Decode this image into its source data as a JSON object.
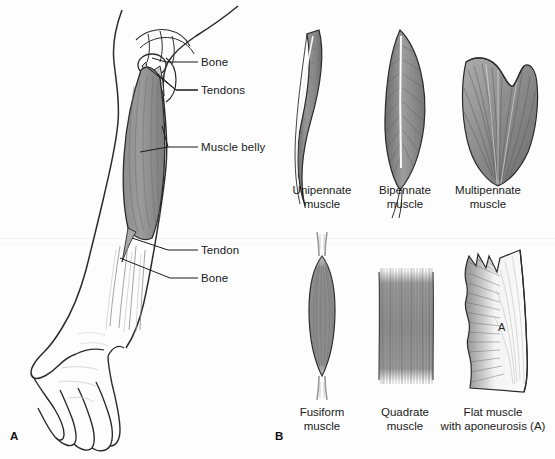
{
  "figure": {
    "panels": [
      {
        "letter": "A"
      },
      {
        "letter": "B"
      }
    ]
  },
  "panel_a": {
    "letter": "A",
    "labels": [
      {
        "id": "bone-upper",
        "text": "Bone"
      },
      {
        "id": "tendons",
        "text": "Tendons"
      },
      {
        "id": "muscle-belly",
        "text": "Muscle belly"
      },
      {
        "id": "tendon-lower",
        "text": "Tendon"
      },
      {
        "id": "bone-lower",
        "text": "Bone"
      }
    ]
  },
  "panel_b": {
    "letter": "B",
    "items": [
      {
        "id": "unipennate",
        "line1": "Unipennate",
        "line2": "muscle"
      },
      {
        "id": "bipennate",
        "line1": "Bipennate",
        "line2": "muscle"
      },
      {
        "id": "multipennate",
        "line1": "Multipennate",
        "line2": "muscle"
      },
      {
        "id": "fusiform",
        "line1": "Fusiform",
        "line2": "muscle"
      },
      {
        "id": "quadrate",
        "line1": "Quadrate",
        "line2": "muscle"
      },
      {
        "id": "flat",
        "line1": "Flat muscle",
        "line2": "with aponeurosis (A)"
      }
    ],
    "aponeurosis_marker": "A"
  },
  "colors": {
    "background": "#fdfdfd",
    "ink": "#1a1a1a",
    "outline": "#2b2b2b",
    "muscle_fill": "#8c8c8c",
    "muscle_fill_dark": "#6f6f6f",
    "muscle_fill_light": "#b5b5b5",
    "tendon": "#f2f2f2",
    "aponeurosis": "#f6f6f6"
  }
}
